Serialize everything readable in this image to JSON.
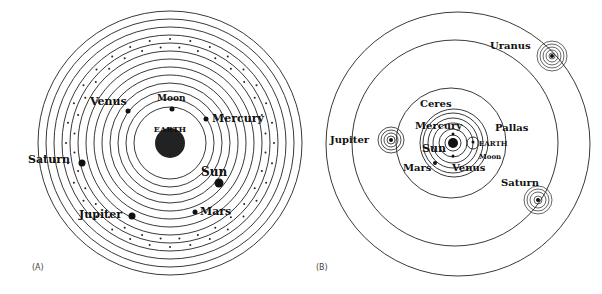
{
  "panel_a": {
    "caption": "(A)",
    "title": "Geocentric (Ptolemaic) system",
    "center": "EARTH",
    "bodies": [
      {
        "name": "Moon",
        "x": 172,
        "y": 109
      },
      {
        "name": "Venus",
        "x": 128,
        "y": 111
      },
      {
        "name": "Mercury",
        "x": 206,
        "y": 119
      },
      {
        "name": "Sun",
        "x": 219,
        "y": 183
      },
      {
        "name": "Mars",
        "x": 195,
        "y": 212
      },
      {
        "name": "Jupiter",
        "x": 132,
        "y": 216
      },
      {
        "name": "Saturn",
        "x": 82,
        "y": 163
      }
    ]
  },
  "panel_b": {
    "caption": "(B)",
    "title": "Heliocentric system",
    "bodies": [
      "Sun",
      "Mercury",
      "Venus",
      "EARTH",
      "Moon",
      "Mars",
      "Ceres",
      "Pallas",
      "Jupiter",
      "Saturn",
      "Uranus"
    ]
  },
  "colors": {
    "ink": "#111111",
    "background": "#ffffff"
  }
}
